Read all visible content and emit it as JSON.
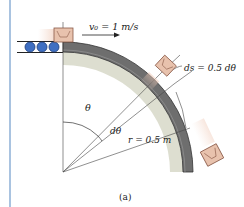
{
  "labels": {
    "velocity": "v₀ = 1 m/s",
    "arc_length": "ds = 0.5 dθ",
    "theta": "θ",
    "dtheta": "dθ",
    "radius": "r = 0.5 m",
    "caption": "(a)"
  },
  "colors": {
    "left_border": "#a9c3e0",
    "track_fill": "#6e6e6e",
    "track_edge": "#3a3a3a",
    "shadow": "#c9cbb8",
    "box_fill": "#e8c2ad",
    "box_edge": "#8a5a48",
    "roller": "#3f6fc2"
  },
  "elements": {
    "rollers_count": 3,
    "packages_count": 3
  }
}
